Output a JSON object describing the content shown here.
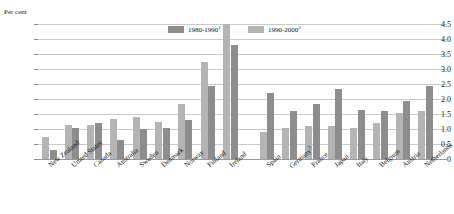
{
  "chart": {
    "unit_label": "Per cent",
    "y_ticks": [
      "4.5",
      "4.0",
      "3.5",
      "3.0",
      "2.5",
      "2.0",
      "1.5",
      "1.0",
      "0.5",
      "0"
    ],
    "legend": [
      {
        "label": "1980-1990",
        "note": "1",
        "color": "#8d8d8d",
        "name": "legend-1980-1990"
      },
      {
        "label": "1990-2000",
        "note": "2",
        "color": "#b4b4b4",
        "name": "legend-1990-2000"
      }
    ]
  },
  "chart_data": {
    "type": "bar",
    "title": "",
    "subtitle": "",
    "xlabel": "",
    "ylabel": "Per cent",
    "ylim": [
      0,
      4.5
    ],
    "ytick_step": 0.5,
    "grid": true,
    "legend_position": "top-center",
    "group_gap_after_index": 9,
    "categories": [
      "New Zealand",
      "United States",
      "Canada",
      "Australia",
      "Sweden",
      "Denmark",
      "Norway",
      "Finland",
      "Ireland",
      "Spain",
      "Germany",
      "France",
      "Japan",
      "Italy",
      "Belgium",
      "Austria",
      "Netherlands"
    ],
    "category_notes": {
      "Germany": "3"
    },
    "series": [
      {
        "name": "1980-1990",
        "color": "#8d8d8d",
        "values": [
          0.3,
          1.05,
          1.2,
          0.65,
          1.0,
          1.05,
          1.3,
          2.45,
          3.8,
          2.2,
          1.6,
          1.85,
          2.35,
          1.65,
          1.6,
          1.95,
          2.45
        ]
      },
      {
        "name": "1990-2000",
        "color": "#b4b4b4",
        "values": [
          0.75,
          1.15,
          1.15,
          1.35,
          1.4,
          1.25,
          1.85,
          3.25,
          4.5,
          0.9,
          1.05,
          1.1,
          1.1,
          1.05,
          1.2,
          1.55,
          1.6
        ]
      }
    ]
  }
}
